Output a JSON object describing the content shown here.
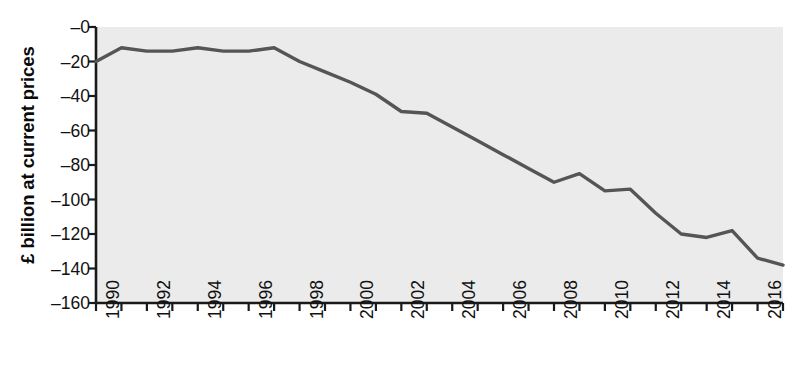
{
  "chart_data": {
    "type": "line",
    "title": "",
    "xlabel": "",
    "ylabel": "£ billion at current prices",
    "x": [
      1990,
      1991,
      1992,
      1993,
      1994,
      1995,
      1996,
      1997,
      1998,
      1999,
      2000,
      2001,
      2002,
      2003,
      2004,
      2005,
      2006,
      2007,
      2008,
      2009,
      2010,
      2011,
      2012,
      2013,
      2014,
      2015,
      2016,
      2017
    ],
    "values": [
      -20,
      -12,
      -14,
      -14,
      -12,
      -14,
      -14,
      -12,
      -20,
      -26,
      -32,
      -39,
      -49,
      -50,
      -58,
      -66,
      -74,
      -82,
      -90,
      -85,
      -95,
      -94,
      -108,
      -120,
      -122,
      -118,
      -134,
      -138
    ],
    "series": [
      {
        "name": "Trade balance",
        "values": [
          -20,
          -12,
          -14,
          -14,
          -12,
          -14,
          -14,
          -12,
          -20,
          -26,
          -32,
          -39,
          -49,
          -50,
          -58,
          -66,
          -74,
          -82,
          -90,
          -85,
          -95,
          -94,
          -108,
          -120,
          -122,
          -118,
          -134,
          -138
        ]
      }
    ],
    "xlim": [
      1990,
      2017
    ],
    "ylim": [
      -160,
      0
    ],
    "ytick_values": [
      0,
      -20,
      -40,
      -60,
      -80,
      -100,
      -120,
      -140,
      -160
    ],
    "ytick_labels": [
      "–0",
      "–20",
      "–40",
      "–60",
      "–80",
      "–100",
      "–120",
      "–140",
      "–160"
    ],
    "xtick_values": [
      1990,
      1991,
      1992,
      1993,
      1994,
      1995,
      1996,
      1997,
      1998,
      1999,
      2000,
      2001,
      2002,
      2003,
      2004,
      2005,
      2006,
      2007,
      2008,
      2009,
      2010,
      2011,
      2012,
      2013,
      2014,
      2015,
      2016,
      2017
    ],
    "xtick_labels": [
      "1990",
      "",
      "1992",
      "",
      "1994",
      "",
      "1996",
      "",
      "1998",
      "",
      "2000",
      "",
      "2002",
      "",
      "2004",
      "",
      "2006",
      "",
      "2008",
      "",
      "2010",
      "",
      "2012",
      "",
      "2014",
      "",
      "2016",
      ""
    ],
    "grid": false,
    "legend": "none",
    "line_color": "#555555",
    "plot_background": "#ebebeb",
    "axis_color": "#1a1a1a"
  }
}
